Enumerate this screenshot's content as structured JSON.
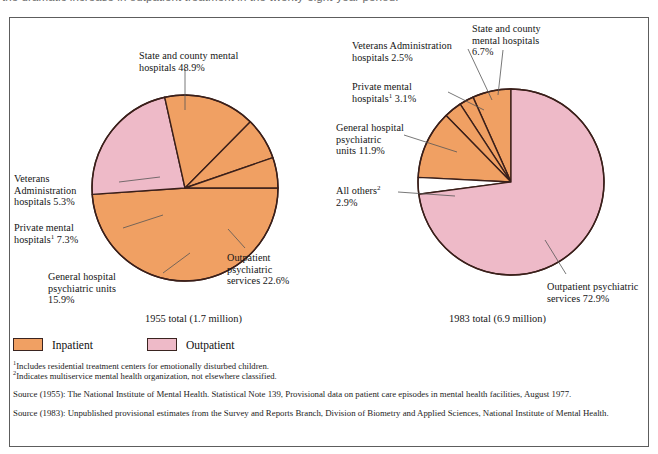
{
  "caption": {
    "text": "the dramatic increase in outpatient treatment in the twenty-eight-year period."
  },
  "colors": {
    "inpatient": "#F0A063",
    "outpatient": "#EEBAC8",
    "other": "#FFFFFF",
    "outline": "#3A1F1A",
    "leader": "#555555",
    "border": "#5D5D5D"
  },
  "legend": {
    "items": [
      {
        "label": "Inpatient",
        "color": "#F0A063",
        "name": "inpatient"
      },
      {
        "label": "Outpatient",
        "color": "#EEBAC8",
        "name": "outpatient"
      }
    ]
  },
  "footnotes": [
    {
      "marker": "1",
      "text": "Includes residential treatment centers for emotionally disturbed children."
    },
    {
      "marker": "2",
      "text": "Indicates multiservice mental health organization, not elsewhere classified."
    }
  ],
  "sources": [
    "Source (1955):  The National Institute of Mental Health.  Statistical Note 139, Provisional data on patient care episodes in mental health facilities, August 1977.",
    "Source (1983):  Unpublished provisional estimates from the Survey and Reports Branch, Division of Biometry and Applied Sciences, National Institute of Mental Health."
  ],
  "labels": {
    "left": {
      "state_county": "State and county mental\nhospitals 48.9%",
      "veterans": "Veterans\nAdministration\nhospitals 5.3%",
      "private_a": "Private mental",
      "private_b": " 7.3%",
      "general": "General hospital\npsychiatric units\n15.9%",
      "outpatient": "Outpatient\npsychiatric\nservices 22.6%",
      "total": "1955 total (1.7 million)"
    },
    "right": {
      "state_county": "State and county\nmental hospitals\n6.7%",
      "veterans": "Veterans Administration\nhospitals 2.5%",
      "private_a": "Private mental",
      "private_b": " 3.1%",
      "general": "General hospital\npsychiatric\nunits 11.9%",
      "allothers_a": "All others",
      "allothers_b": "2.9%",
      "outpatient": "Outpatient psychiatric\nservices 72.9%",
      "total": "1983 total (6.9 million)"
    }
  },
  "chart_data": [
    {
      "type": "pie",
      "name": "1955",
      "title": "1955 total (1.7 million)",
      "total_label": "1.7 million",
      "total_value": 1.7,
      "units": "million patient care episodes",
      "start_angle_deg": 0,
      "direction": "clockwise",
      "center": [
        185,
        188
      ],
      "radius": 93,
      "legend": [
        "Inpatient",
        "Outpatient"
      ],
      "categories": [
        "State and county mental hospitals",
        "Outpatient psychiatric services",
        "General hospital psychiatric units",
        "Private mental hospitals",
        "Veterans Administration hospitals"
      ],
      "values": [
        48.9,
        22.6,
        15.9,
        7.3,
        5.3
      ],
      "slices": [
        {
          "label": "State and county mental hospitals",
          "value": 48.9,
          "group": "Inpatient",
          "color": "#F0A063"
        },
        {
          "label": "Outpatient psychiatric services",
          "value": 22.6,
          "group": "Outpatient",
          "color": "#EEBAC8"
        },
        {
          "label": "General hospital psychiatric units",
          "value": 15.9,
          "group": "Inpatient",
          "color": "#F0A063"
        },
        {
          "label": "Private mental hospitals",
          "value": 7.3,
          "group": "Inpatient",
          "color": "#F0A063",
          "footnote": "1"
        },
        {
          "label": "Veterans Administration hospitals",
          "value": 5.3,
          "group": "Inpatient",
          "color": "#F0A063"
        }
      ]
    },
    {
      "type": "pie",
      "name": "1983",
      "title": "1983 total (6.9 million)",
      "total_label": "6.9 million",
      "total_value": 6.9,
      "units": "million patient care episodes",
      "start_angle_deg": -90,
      "direction": "counterclockwise",
      "center": [
        511,
        182
      ],
      "radius": 93,
      "legend": [
        "Inpatient",
        "Outpatient"
      ],
      "categories": [
        "State and county mental hospitals",
        "Veterans Administration hospitals",
        "Private mental hospitals",
        "General hospital psychiatric units",
        "All others",
        "Outpatient psychiatric services"
      ],
      "values": [
        6.7,
        2.5,
        3.1,
        11.9,
        2.9,
        72.9
      ],
      "slices": [
        {
          "label": "State and county mental hospitals",
          "value": 6.7,
          "group": "Inpatient",
          "color": "#F0A063"
        },
        {
          "label": "Veterans Administration hospitals",
          "value": 2.5,
          "group": "Inpatient",
          "color": "#F0A063"
        },
        {
          "label": "Private mental hospitals",
          "value": 3.1,
          "group": "Inpatient",
          "color": "#F0A063",
          "footnote": "1"
        },
        {
          "label": "General hospital psychiatric units",
          "value": 11.9,
          "group": "Inpatient",
          "color": "#F0A063"
        },
        {
          "label": "All others",
          "value": 2.9,
          "group": "Other",
          "color": "#FFFFFF",
          "footnote": "2"
        },
        {
          "label": "Outpatient psychiatric services",
          "value": 72.9,
          "group": "Outpatient",
          "color": "#EEBAC8"
        }
      ]
    }
  ]
}
